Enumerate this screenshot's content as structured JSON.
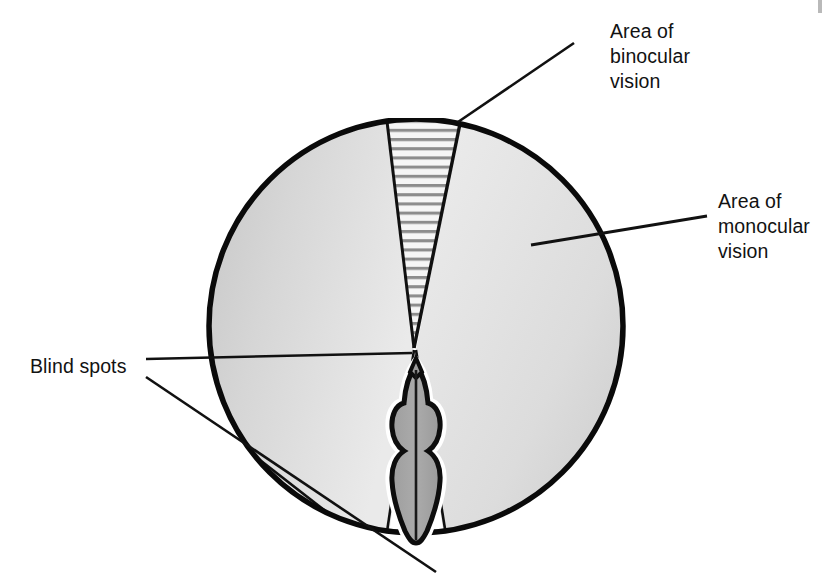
{
  "figure": {
    "background_color": "#ffffff"
  },
  "labels": {
    "binocular": {
      "lines": [
        "Area of",
        "binocular",
        "vision"
      ],
      "full_text": "Area of binocular vision",
      "x": 610,
      "y": 38,
      "leader": {
        "x1": 458,
        "y1": 122,
        "x2": 574,
        "y2": 43
      }
    },
    "monocular": {
      "lines": [
        "Area of",
        "monocular",
        "vision"
      ],
      "full_text": "Area of monocular vision",
      "x": 718,
      "y": 208,
      "leader": {
        "x1": 531,
        "y1": 245,
        "x2": 707,
        "y2": 216
      }
    },
    "blind_spots": {
      "lines": [
        "Blind spots"
      ],
      "full_text": "Blind spots",
      "x": 30,
      "y": 366,
      "leader_upper": {
        "x1": 146,
        "y1": 359,
        "x2": 412,
        "y2": 353
      },
      "leader_lower": {
        "x1": 146,
        "y1": 377,
        "x2": 436,
        "y2": 572
      }
    }
  },
  "diagram": {
    "circle": {
      "center_x": 416,
      "center_y": 326,
      "radius": 209,
      "stroke_color": "#000000",
      "stroke_width": 5
    },
    "colors": {
      "monocular_fill_light": "#e8e8e8",
      "monocular_fill_dark": "#bcbcbc",
      "binocular_hatch_stroke": "#8f8f8f",
      "binocular_fill": "#f4f4f4",
      "blind_spot_fill": "#ffffff",
      "head_fill": "#a8a8a8",
      "outline": "#000000"
    },
    "sectors": [
      {
        "name": "binocular-wedge",
        "position": "top-center",
        "pattern": "horizontal-hatch"
      },
      {
        "name": "monocular-left",
        "position": "left",
        "pattern": "gradient-gray"
      },
      {
        "name": "monocular-right",
        "position": "right",
        "pattern": "gradient-gray"
      },
      {
        "name": "blind-spot-rear",
        "position": "bottom-center",
        "pattern": "white"
      },
      {
        "name": "blind-spot-sliver",
        "position": "lower-left-rim",
        "pattern": "white"
      }
    ],
    "bird_head": {
      "name": "bird-head-top-view",
      "beak_direction": "up",
      "center_x": 416,
      "top_y": 364,
      "bottom_y": 540
    }
  }
}
